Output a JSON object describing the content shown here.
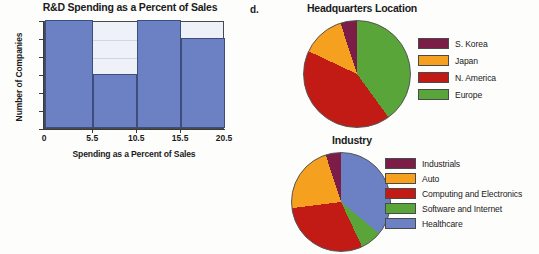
{
  "panel_letter": "d.",
  "histogram": {
    "title": "R&D Spending as a Percent of Sales",
    "xlabel": "Spending as a Percent of Sales",
    "ylabel": "Number of Companies",
    "bar_color": "#6b81c3",
    "plot_bg": "#eef1f7",
    "y_ticks": [
      "6",
      "5",
      "4",
      "3",
      "2",
      "1",
      "0"
    ],
    "x_ticks": [
      "0",
      "5.5",
      "10.5",
      "15.5",
      "20.5"
    ]
  },
  "hq_chart": {
    "title": "Headquarters Location",
    "legend": [
      {
        "label": "S. Korea",
        "color": "#7b1d46"
      },
      {
        "label": "Japan",
        "color": "#f5a01e"
      },
      {
        "label": "N. America",
        "color": "#c21a15"
      },
      {
        "label": "Europe",
        "color": "#5aa53a"
      }
    ]
  },
  "industry_chart": {
    "title": "Industry",
    "legend": [
      {
        "label": "Industrials",
        "color": "#7b1d46"
      },
      {
        "label": "Auto",
        "color": "#f5a01e"
      },
      {
        "label": "Computing and Electronics",
        "color": "#c21a15"
      },
      {
        "label": "Software and Internet",
        "color": "#5aa53a"
      },
      {
        "label": "Healthcare",
        "color": "#6b81c3"
      }
    ]
  },
  "chart_data": [
    {
      "type": "bar",
      "title": "R&D Spending as a Percent of Sales",
      "xlabel": "Spending as a Percent of Sales",
      "ylabel": "Number of Companies",
      "categories": [
        "0-5.5",
        "5.5-10.5",
        "10.5-15.5",
        "15.5-20.5"
      ],
      "bin_edges": [
        0,
        5.5,
        10.5,
        15.5,
        20.5
      ],
      "values": [
        6,
        3,
        6,
        5
      ],
      "xlim": [
        0,
        20.5
      ],
      "ylim": [
        0,
        6
      ],
      "xtick_labels": [
        "0",
        "5.5",
        "10.5",
        "15.5",
        "20.5"
      ],
      "ytick_labels": [
        "0",
        "1",
        "2",
        "3",
        "4",
        "5",
        "6"
      ],
      "grid": true,
      "legend_position": "none"
    },
    {
      "type": "pie",
      "title": "Headquarters Location",
      "labels": [
        "S. Korea",
        "Japan",
        "N. America",
        "Europe"
      ],
      "values": [
        5,
        13,
        42,
        40
      ],
      "colors": [
        "#7b1d46",
        "#f5a01e",
        "#c21a15",
        "#5aa53a"
      ],
      "legend_position": "right",
      "start_angle_deg": 0,
      "direction": "clockwise"
    },
    {
      "type": "pie",
      "title": "Industry",
      "labels": [
        "Industrials",
        "Auto",
        "Computing and Electronics",
        "Software and Internet",
        "Healthcare"
      ],
      "values": [
        5,
        22,
        30,
        7,
        36
      ],
      "colors": [
        "#7b1d46",
        "#f5a01e",
        "#c21a15",
        "#5aa53a",
        "#6b81c3"
      ],
      "legend_position": "right",
      "start_angle_deg": 0,
      "direction": "clockwise"
    }
  ]
}
